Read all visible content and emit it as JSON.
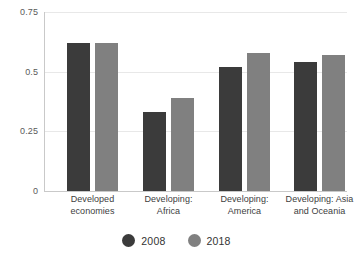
{
  "chart_data": {
    "type": "bar",
    "title": "",
    "subtitle": "",
    "xlabel": "",
    "ylabel": "",
    "ylim": [
      0,
      0.75
    ],
    "yticks": [
      "0",
      "0.25",
      "0.5",
      "0.75"
    ],
    "ytick_values": [
      0,
      0.25,
      0.5,
      0.75
    ],
    "grid": true,
    "legend_position": "bottom",
    "categories": [
      "Developed economies",
      "Developing: Africa",
      "Developing: America",
      "Developing: Asia and Oceania"
    ],
    "category_lines": [
      [
        "Developed",
        "economies"
      ],
      [
        "Developing:",
        "Africa"
      ],
      [
        "Developing:",
        "America"
      ],
      [
        "Developing: Asia",
        "and Oceania"
      ]
    ],
    "series": [
      {
        "name": "2008",
        "color": "#3b3b3b",
        "values": [
          0.62,
          0.33,
          0.52,
          0.54
        ]
      },
      {
        "name": "2018",
        "color": "#808080",
        "values": [
          0.62,
          0.39,
          0.58,
          0.57
        ]
      }
    ]
  },
  "colors": {
    "series_2008": "#3b3b3b",
    "series_2018": "#808080",
    "gridline": "#e8e8e8",
    "axis": "#c9c9c9",
    "tick_text": "#5a5a5a",
    "label_text": "#404040",
    "background": "#ffffff"
  }
}
